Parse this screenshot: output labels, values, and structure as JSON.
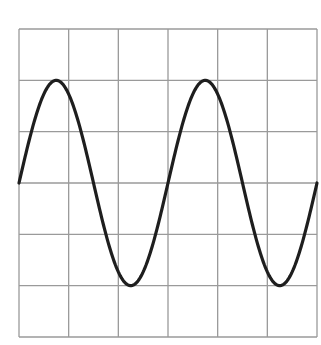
{
  "diagram": {
    "type": "sine-wave-on-grid",
    "grid": {
      "left": 19,
      "top": 29,
      "right": 317,
      "bottom": 337,
      "cols": 6,
      "rows": 6,
      "color": "#9a9a9a"
    },
    "wave": {
      "cycles": 2,
      "amplitude_divisions": 2,
      "phase": "starts at zero crossing going up",
      "color": "#1e1e1e",
      "stroke_width": 3.2
    }
  },
  "chart_data": {
    "type": "line",
    "title": "",
    "xlabel": "",
    "ylabel": "",
    "function": "y = 2*sin(2*pi*x/3)",
    "x_divisions": 6,
    "y_divisions": 6,
    "xlim": [
      0,
      6
    ],
    "ylim": [
      -3,
      3
    ],
    "grid": true,
    "key_points": [
      {
        "x": 0,
        "y": 0
      },
      {
        "x": 0.75,
        "y": 2
      },
      {
        "x": 1.5,
        "y": 0
      },
      {
        "x": 2.25,
        "y": -2
      },
      {
        "x": 3,
        "y": 0
      },
      {
        "x": 3.75,
        "y": 2
      },
      {
        "x": 4.5,
        "y": 0
      },
      {
        "x": 5.25,
        "y": -2
      },
      {
        "x": 6,
        "y": 0
      }
    ]
  }
}
